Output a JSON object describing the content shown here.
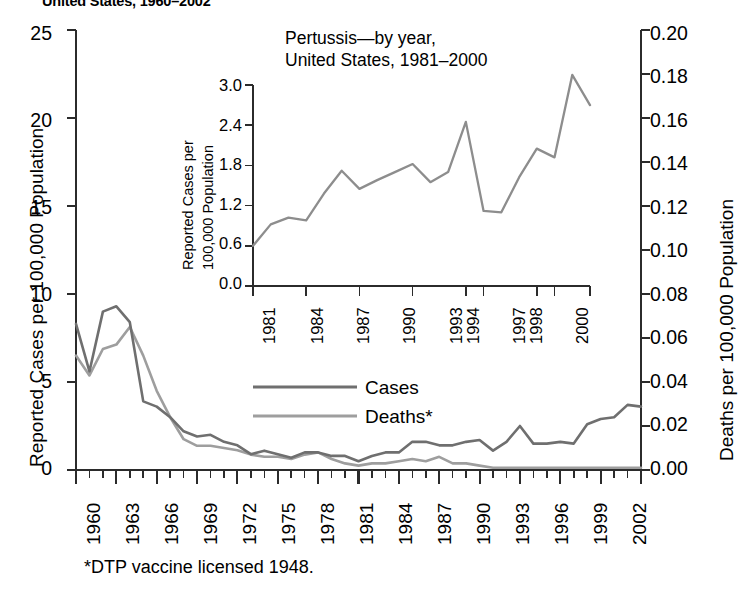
{
  "figure": {
    "title_line": "United States, 1960–2002",
    "footnote": "*DTP vaccine licensed 1948."
  },
  "legend": {
    "position": "inside-center",
    "items": [
      {
        "label": "Cases",
        "color": "#6f6f6f"
      },
      {
        "label": "Deaths*",
        "color": "#9e9e9e"
      }
    ]
  },
  "chart_data": [
    {
      "id": "main",
      "type": "line",
      "title": "United States, 1960–2002",
      "xlabel": "",
      "ylabel": "Reported Cases per 100,000 Population",
      "y2label": "Deaths per 100,000 Population",
      "xlim": [
        1960,
        2002
      ],
      "ylim": [
        0,
        25
      ],
      "y2lim": [
        0,
        0.2
      ],
      "grid": false,
      "yticks": [
        0,
        5,
        10,
        15,
        20,
        25
      ],
      "ytick_labels": [
        "0",
        "5",
        "10",
        "15",
        "20",
        "25"
      ],
      "y2ticks": [
        0.0,
        0.02,
        0.04,
        0.06,
        0.08,
        0.1,
        0.12,
        0.14,
        0.16,
        0.18,
        0.2
      ],
      "y2tick_labels": [
        "0.00",
        "0.02",
        "0.04",
        "0.06",
        "0.08",
        "0.10",
        "0.12",
        "0.14",
        "0.16",
        "0.18",
        "0.20"
      ],
      "xticks": [
        1960,
        1963,
        1966,
        1969,
        1972,
        1975,
        1978,
        1981,
        1984,
        1987,
        1990,
        1993,
        1996,
        1999,
        2002
      ],
      "xtick_labels": [
        "1960",
        "1963",
        "1966",
        "1969",
        "1972",
        "1975",
        "1978",
        "1981",
        "1984",
        "1987",
        "1990",
        "1993",
        "1996",
        "1999",
        "2002"
      ],
      "x": [
        1960,
        1961,
        1962,
        1963,
        1964,
        1965,
        1966,
        1967,
        1968,
        1969,
        1970,
        1971,
        1972,
        1973,
        1974,
        1975,
        1976,
        1977,
        1978,
        1979,
        1980,
        1981,
        1982,
        1983,
        1984,
        1985,
        1986,
        1987,
        1988,
        1989,
        1990,
        1991,
        1992,
        1993,
        1994,
        1995,
        1996,
        1997,
        1998,
        1999,
        2000,
        2001,
        2002
      ],
      "series": [
        {
          "name": "Cases",
          "axis": "left",
          "color": "#6f6f6f",
          "units": "cases per 100,000 population",
          "values": [
            8.3,
            5.6,
            9.0,
            9.3,
            8.4,
            3.9,
            3.6,
            3.0,
            2.2,
            1.9,
            2.0,
            1.6,
            1.4,
            0.9,
            1.1,
            0.9,
            0.7,
            1.0,
            1.0,
            0.8,
            0.8,
            0.5,
            0.8,
            1.0,
            1.0,
            1.6,
            1.6,
            1.4,
            1.4,
            1.6,
            1.7,
            1.1,
            1.6,
            2.5,
            1.5,
            1.5,
            1.6,
            1.5,
            2.6,
            2.9,
            3.0,
            3.7,
            3.6
          ]
        },
        {
          "name": "Deaths*",
          "axis": "right",
          "color": "#9e9e9e",
          "units": "deaths per 100,000 population",
          "values": [
            0.052,
            0.043,
            0.055,
            0.057,
            0.065,
            0.052,
            0.036,
            0.024,
            0.014,
            0.011,
            0.011,
            0.01,
            0.009,
            0.007,
            0.006,
            0.006,
            0.005,
            0.007,
            0.008,
            0.005,
            0.003,
            0.002,
            0.003,
            0.003,
            0.004,
            0.005,
            0.004,
            0.006,
            0.003,
            0.003,
            0.002,
            0.001,
            0.001,
            0.001,
            0.001,
            0.001,
            0.001,
            0.001,
            0.001,
            0.001,
            0.001,
            0.001,
            0.001
          ]
        }
      ]
    },
    {
      "id": "inset",
      "type": "line",
      "title_line1": "Pertussis—by year,",
      "title_line2": "United States, 1981–2000",
      "xlabel": "",
      "ylabel": "Reported Cases per 100,000 Population",
      "xlim": [
        1981,
        2000
      ],
      "ylim": [
        0.0,
        3.0
      ],
      "grid": false,
      "yticks": [
        0.0,
        0.6,
        1.2,
        1.8,
        2.4,
        3.0
      ],
      "ytick_labels": [
        "0.0",
        "0.6",
        "1.2",
        "1.8",
        "2.4",
        "3.0"
      ],
      "xticks": [
        1981,
        1984,
        1987,
        1990,
        1993,
        1994,
        1997,
        1998,
        2000
      ],
      "xtick_labels": [
        "1981",
        "1984",
        "1987",
        "1990",
        "1993",
        "1994",
        "1997",
        "1998",
        "2000"
      ],
      "x": [
        1981,
        1982,
        1983,
        1984,
        1985,
        1986,
        1987,
        1988,
        1989,
        1990,
        1991,
        1992,
        1993,
        1994,
        1995,
        1996,
        1997,
        1998,
        1999,
        2000
      ],
      "series": [
        {
          "name": "Reported Cases",
          "color": "#8d8d8d",
          "units": "cases per 100,000 population",
          "values": [
            0.6,
            0.92,
            1.02,
            0.98,
            1.38,
            1.72,
            1.45,
            1.58,
            1.7,
            1.82,
            1.55,
            1.7,
            2.45,
            1.12,
            1.1,
            1.62,
            2.05,
            1.92,
            3.15,
            2.7
          ]
        }
      ]
    }
  ]
}
